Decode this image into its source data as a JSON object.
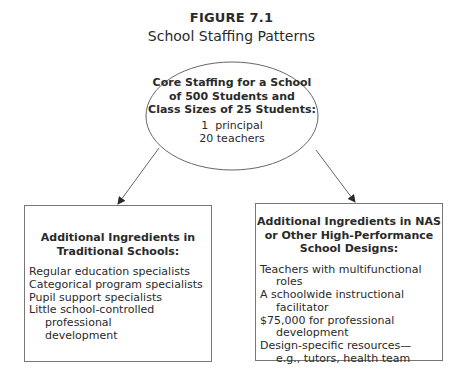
{
  "figure": {
    "label": "FIGURE 7.1",
    "title": "School Staffing Patterns"
  },
  "core": {
    "heading_lines": [
      "Core Staffing for a School",
      "of 500 Students and",
      "Class Sizes of 25 Students:"
    ],
    "items": [
      "1  principal",
      "20 teachers"
    ]
  },
  "traditional": {
    "heading_lines": [
      "Additional Ingredients in",
      "Traditional Schools:"
    ],
    "items": [
      "Regular education specialists",
      "Categorical program specialists",
      "Pupil support specialists",
      "Little school-controlled professional development"
    ]
  },
  "high_performance": {
    "heading_lines": [
      "Additional Ingredients in NAS",
      "or Other High-Performance",
      "School Designs:"
    ],
    "items": [
      "Teachers with multifunctional roles",
      "A schoolwide instructional facilitator",
      "$75,000 for professional development",
      "Design-specific resources—e.g., tutors, health team"
    ]
  }
}
